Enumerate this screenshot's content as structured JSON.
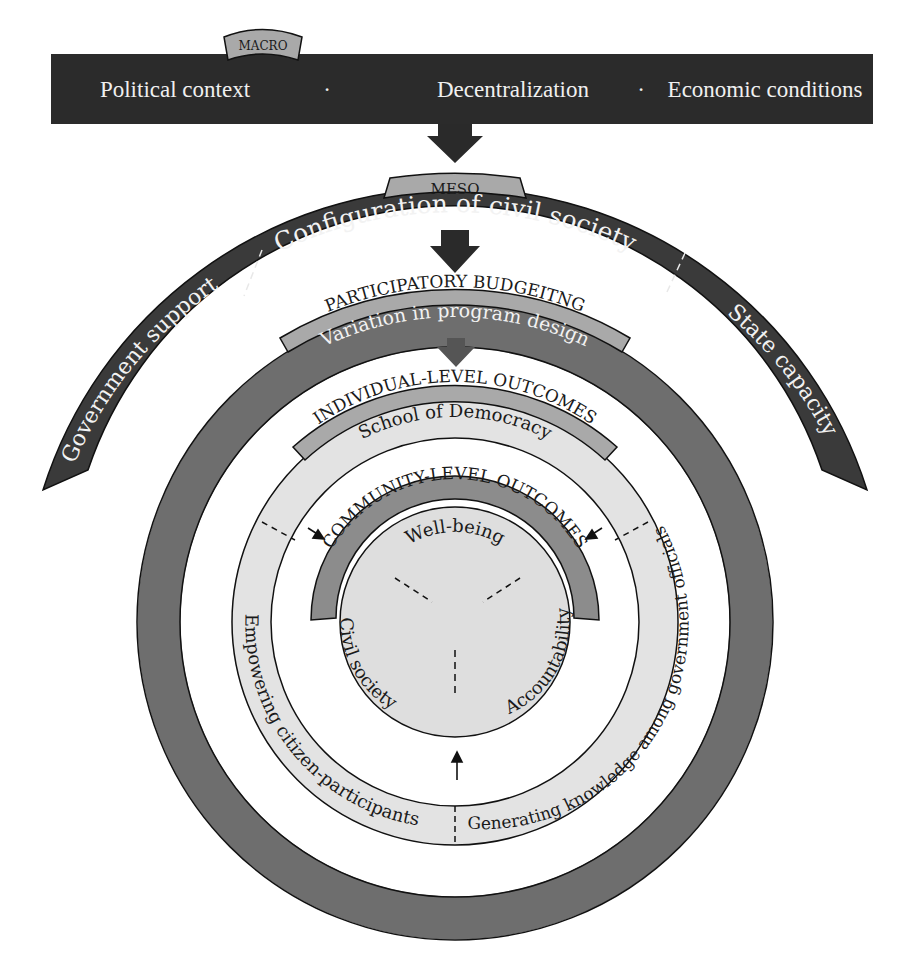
{
  "macro": {
    "tab_label": "MACRO",
    "items": [
      "Political context",
      "Decentralization",
      "Economic conditions"
    ],
    "separator": "·"
  },
  "meso": {
    "tab_label": "MESO",
    "arc_top_label": "Configuration of civil society",
    "arc_left_label": "Government support",
    "arc_right_label": "State capacity"
  },
  "participatory_budgeting": {
    "tab_label": "PARTICIPATORY BUDGEITNG",
    "ring_label": "Variation in program design"
  },
  "individual_level": {
    "tab_label": "INDIVIDUAL-LEVEL OUTCOMES",
    "ring_top_label": "School of Democracy",
    "ring_left_label": "Empowering citizen-participants",
    "ring_right_label": "Generating knowledge among government officials"
  },
  "community_level": {
    "tab_label": "COMMUNITY-LEVEL OUTCOMES",
    "segments": [
      "Well-being",
      "Civil society",
      "Accountability"
    ]
  },
  "colors": {
    "macro_bar": "#2b2b2b",
    "meso_arc": "#3a3a3a",
    "pb_ring": "#6e6e6e",
    "tab_fill": "#a9a9a9",
    "individual_ring": "#e3e3e3",
    "community_band": "#8c8c8c",
    "inner_circle": "#dedede",
    "arrow": "#2a2a2a"
  }
}
